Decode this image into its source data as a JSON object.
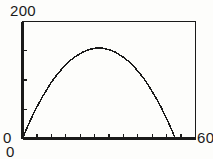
{
  "figure": {
    "background_color": "#fdfdfb",
    "ink_color": "#1a1a1a"
  },
  "labels": {
    "y_max": "200",
    "y_min": "0",
    "x_min": "0",
    "x_max": "60"
  },
  "chart_data": {
    "type": "line",
    "title": "",
    "subtitle": "",
    "xlabel": "",
    "ylabel": "",
    "xlim": [
      0,
      60
    ],
    "ylim": [
      0,
      200
    ],
    "xticks": [
      0,
      5,
      10,
      15,
      20,
      25,
      30,
      35,
      40,
      45,
      50,
      55,
      60
    ],
    "yticks": [
      0,
      50,
      100,
      150,
      200
    ],
    "xticklabels": [
      "0",
      "",
      "",
      "",
      "",
      "",
      "",
      "",
      "",
      "",
      "",
      "",
      "60"
    ],
    "yticklabels": [
      "0",
      "",
      "",
      "",
      "200"
    ],
    "grid": false,
    "legend": null,
    "frame": "box",
    "tick_direction": "in",
    "series": [
      {
        "name": "trajectory",
        "color": "#1a1a1a",
        "linewidth": 1,
        "x": [
          0,
          1,
          2,
          3,
          4,
          5,
          6,
          7,
          8,
          9,
          10,
          11,
          12,
          13,
          14,
          15,
          16,
          17,
          18,
          19,
          20,
          21,
          22,
          23,
          24,
          25,
          26,
          27,
          28,
          29,
          30,
          31,
          32,
          33,
          34,
          35,
          36,
          37,
          38,
          39,
          40,
          41,
          42,
          43,
          44,
          45,
          46,
          47,
          48,
          49,
          50,
          51,
          52,
          53
        ],
        "y": [
          0,
          12,
          23,
          34,
          44,
          54,
          63,
          72,
          80,
          88,
          96,
          103,
          109,
          115,
          121,
          126,
          131,
          135,
          139,
          142,
          145,
          148,
          150,
          152,
          153,
          154,
          155,
          155,
          154,
          153,
          152,
          150,
          148,
          145,
          142,
          139,
          135,
          131,
          126,
          121,
          115,
          109,
          103,
          96,
          88,
          80,
          72,
          63,
          54,
          44,
          34,
          23,
          12,
          0
        ]
      }
    ]
  }
}
